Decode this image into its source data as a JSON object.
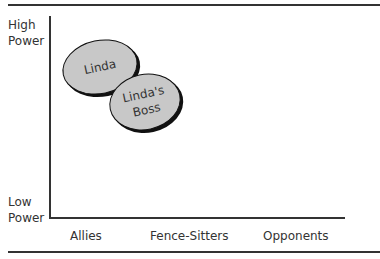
{
  "figure": {
    "y_axis": {
      "high_label_line1": "High",
      "high_label_line2": "Power",
      "low_label_line1": "Low",
      "low_label_line2": "Power"
    },
    "x_axis": {
      "categories": [
        "Allies",
        "Fence-Sitters",
        "Opponents"
      ]
    },
    "nodes": [
      {
        "label_line1": "Linda",
        "label_line2": ""
      },
      {
        "label_line1": "Linda's",
        "label_line2": "Boss"
      }
    ],
    "colors": {
      "ellipse_fill": "#c8c8c8",
      "ellipse_stroke": "#111111",
      "axis": "#333333"
    }
  }
}
